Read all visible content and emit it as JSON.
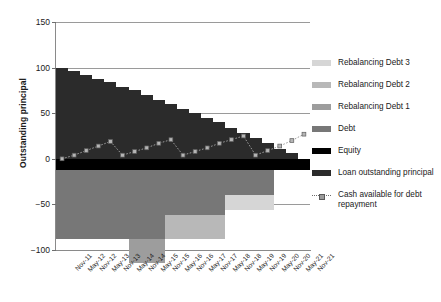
{
  "chart_data": {
    "type": "bar",
    "title": "",
    "subtitle": "",
    "xlabel": "",
    "ylabel": "Outstanding principal",
    "ylim": [
      -100,
      150
    ],
    "yticks": [
      150,
      100,
      50,
      0,
      -50,
      -100
    ],
    "ytick_labels": [
      "150",
      "100",
      "50",
      "0",
      "−50",
      "−100"
    ],
    "grid": true,
    "grid_axis": "y",
    "legend_position": "right",
    "stacked": true,
    "categories": [
      "Nov-11",
      "May-12",
      "Nov-12",
      "May-13",
      "Nov-13",
      "May-14",
      "Nov-14",
      "May-15",
      "Nov-15",
      "May-16",
      "Nov-16",
      "May-17",
      "Nov-17",
      "May-18",
      "Nov-18",
      "May-19",
      "Nov-19",
      "May-20",
      "Nov-20",
      "May-21",
      "Nov-21"
    ],
    "series": [
      {
        "name": "Loan outstanding principal",
        "color": "#2b2b2b",
        "values": [
          100,
          96,
          92,
          88,
          84,
          79,
          75,
          70,
          65,
          60,
          55,
          50,
          45,
          40,
          34,
          28,
          23,
          17,
          11,
          6,
          0
        ]
      },
      {
        "name": "Equity",
        "color": "#000000",
        "values": [
          -12,
          -12,
          -12,
          -12,
          -12,
          -12,
          -12,
          -12,
          -12,
          -12,
          -12,
          -12,
          -12,
          -12,
          -12,
          -12,
          -12,
          -12,
          -12,
          -12,
          -12
        ]
      },
      {
        "name": "Debt",
        "color": "#777777",
        "values": [
          -76,
          -76,
          -76,
          -76,
          -76,
          -76,
          -76,
          -76,
          -76,
          -50,
          -50,
          -50,
          -50,
          -50,
          -28,
          -28,
          -28,
          -28,
          0,
          0,
          0
        ]
      },
      {
        "name": "Rebalancing Debt 1",
        "color": "#9d9d9d",
        "values": [
          0,
          0,
          0,
          0,
          0,
          0,
          -26,
          -26,
          -26,
          0,
          0,
          0,
          0,
          0,
          0,
          0,
          0,
          0,
          0,
          0,
          0
        ]
      },
      {
        "name": "Rebalancing Debt 2",
        "color": "#b8b8b8",
        "values": [
          0,
          0,
          0,
          0,
          0,
          0,
          0,
          0,
          0,
          -26,
          -26,
          -26,
          -26,
          -26,
          0,
          0,
          0,
          0,
          0,
          0,
          0
        ]
      },
      {
        "name": "Rebalancing Debt 3",
        "color": "#d6d6d6",
        "values": [
          0,
          0,
          0,
          0,
          0,
          0,
          0,
          0,
          0,
          0,
          0,
          0,
          0,
          0,
          -16,
          -16,
          -16,
          -16,
          0,
          0,
          0
        ]
      }
    ],
    "line_series": [
      {
        "name": "Cash available for debt repayment",
        "style": "dotted",
        "marker": "square",
        "color": "#9a9a9a",
        "values": [
          0,
          4,
          9,
          14,
          19,
          4,
          8,
          12,
          17,
          21,
          4,
          8,
          12,
          17,
          21,
          25,
          4,
          9,
          14,
          20,
          27
        ]
      }
    ]
  },
  "axis": {
    "ylabel": "Outstanding principal",
    "ytick_labels": [
      "150",
      "100",
      "50",
      "0",
      "−50",
      "−100"
    ],
    "xtick_labels": [
      "Nov-11",
      "May-12",
      "Nov-12",
      "May-13",
      "Nov-13",
      "May-14",
      "Nov-14",
      "May-15",
      "Nov-15",
      "May-16",
      "Nov-16",
      "May-17",
      "Nov-17",
      "May-18",
      "Nov-18",
      "May-19",
      "Nov-19",
      "May-20",
      "Nov-20",
      "May-21",
      "Nov-21"
    ]
  },
  "legend": {
    "items": [
      {
        "label": "Rebalancing Debt 3",
        "color": "#d6d6d6",
        "kind": "swatch"
      },
      {
        "label": "Rebalancing Debt 2",
        "color": "#b8b8b8",
        "kind": "swatch"
      },
      {
        "label": "Rebalancing Debt 1",
        "color": "#9d9d9d",
        "kind": "swatch"
      },
      {
        "label": "Debt",
        "color": "#777777",
        "kind": "swatch"
      },
      {
        "label": "Equity",
        "color": "#000000",
        "kind": "swatch"
      },
      {
        "label": "Loan outstanding principal",
        "color": "#2b2b2b",
        "kind": "swatch"
      },
      {
        "label": "Cash available for debt repayment",
        "color": "#9a9a9a",
        "kind": "dashed-marker"
      }
    ]
  }
}
